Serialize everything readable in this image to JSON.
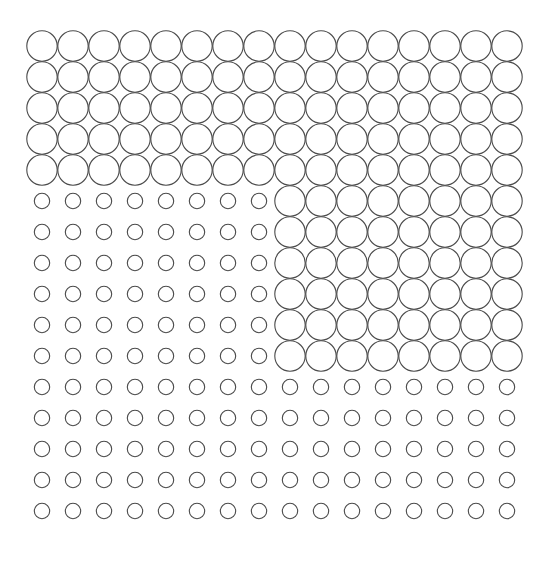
{
  "figure": {
    "type": "circle-grid-stimulus",
    "rows": 16,
    "cols": 16,
    "cell_size": 31,
    "origin_x": 26.5,
    "origin_y": 30.5,
    "large_diameter": 31,
    "small_diameter": 16,
    "stroke_color": "#4a4a4a",
    "stroke_width": 1.1,
    "background": "#ffffff",
    "regions": [
      {
        "name": "top-band-large",
        "size": "large",
        "rows": [
          0,
          4
        ],
        "cols": [
          0,
          15
        ]
      },
      {
        "name": "middle-left-small",
        "size": "small",
        "rows": [
          5,
          10
        ],
        "cols": [
          0,
          7
        ]
      },
      {
        "name": "middle-right-large",
        "size": "large",
        "rows": [
          5,
          10
        ],
        "cols": [
          8,
          15
        ]
      },
      {
        "name": "bottom-band-small",
        "size": "small",
        "rows": [
          11,
          15
        ],
        "cols": [
          0,
          15
        ]
      }
    ]
  }
}
